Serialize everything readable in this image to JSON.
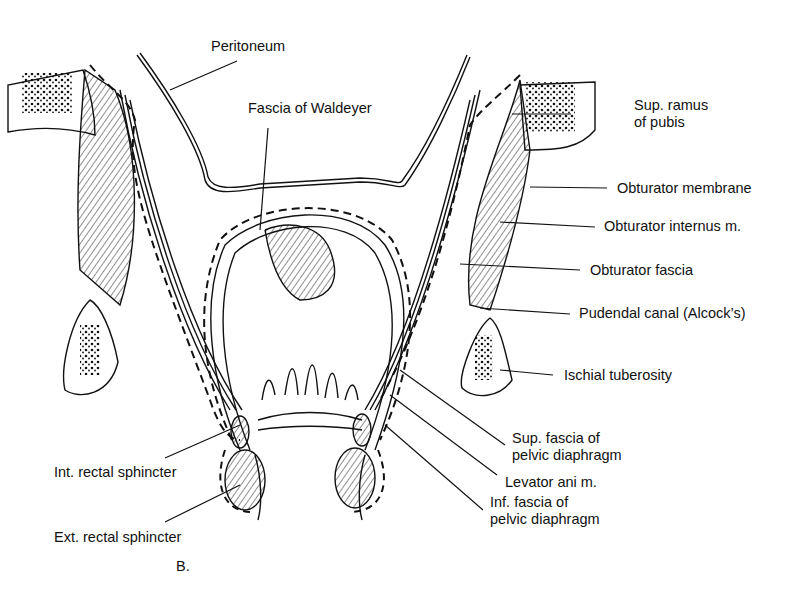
{
  "figure": {
    "panel_label": "B.",
    "labels": {
      "peritoneum": "Peritoneum",
      "fascia_waldeyer": "Fascia of Waldeyer",
      "sup_ramus_1": "Sup. ramus",
      "sup_ramus_2": "of pubis",
      "obturator_membrane": "Obturator membrane",
      "obturator_internus": "Obturator internus m.",
      "obturator_fascia": "Obturator fascia",
      "pudendal_canal": "Pudendal canal (Alcock’s)",
      "ischial_tuberosity": "Ischial tuberosity",
      "sup_fascia_1": "Sup. fascia of",
      "sup_fascia_2": "pelvic diaphragm",
      "levator_ani": "Levator ani m.",
      "inf_fascia_1": "Inf. fascia of",
      "inf_fascia_2": "pelvic diaphragm",
      "int_rectal": "Int. rectal sphincter",
      "ext_rectal": "Ext. rectal sphincter"
    }
  }
}
